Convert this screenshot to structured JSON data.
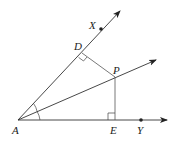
{
  "diagram": {
    "type": "geometry-angle-bisector",
    "colors": {
      "stroke": "#333333",
      "fill": "#ffffff",
      "text": "#222222"
    },
    "points": {
      "A": {
        "label": "A",
        "x": 18,
        "y": 120
      },
      "X": {
        "label": "X",
        "x": 101,
        "y": 29
      },
      "D": {
        "label": "D",
        "x": 82,
        "y": 53
      },
      "P": {
        "label": "P",
        "x": 115,
        "y": 77
      },
      "E": {
        "label": "E",
        "x": 115,
        "y": 120
      },
      "Y": {
        "label": "Y",
        "x": 141,
        "y": 120
      }
    },
    "rays": [
      {
        "name": "ray-AX",
        "from": "A",
        "through": "X"
      },
      {
        "name": "ray-AP",
        "from": "A",
        "through": "P"
      },
      {
        "name": "ray-AY",
        "from": "A",
        "through": "Y"
      }
    ],
    "segments": [
      {
        "name": "segment-DP",
        "from": "D",
        "to": "P"
      },
      {
        "name": "segment-PE",
        "from": "P",
        "to": "E"
      }
    ],
    "right_angles": [
      "D",
      "E"
    ],
    "congruent_angles": [
      "XAP",
      "PAY"
    ]
  }
}
